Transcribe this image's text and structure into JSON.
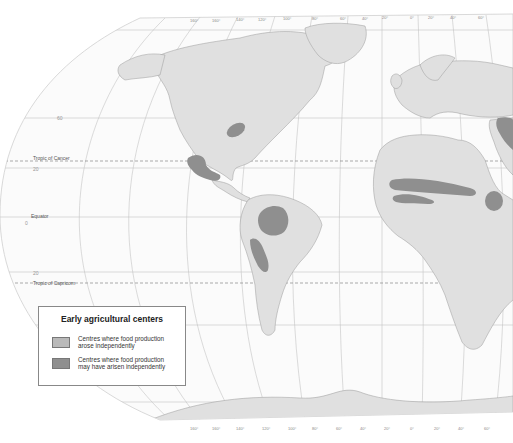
{
  "map": {
    "title": "Early agricultural centers",
    "reference_lines": {
      "tropic_of_cancer": "Tropic of Cancer",
      "equator": "Equator",
      "tropic_of_capricorn": "Tropic of Capricorn"
    },
    "latitude_labels": [
      "60",
      "20",
      "0",
      "20"
    ],
    "longitude_labels_top": [
      "160",
      "160",
      "140",
      "120",
      "100",
      "80",
      "60",
      "40",
      "20",
      "0",
      "20",
      "40",
      "60"
    ],
    "longitude_labels_bottom": [
      "160",
      "160",
      "140",
      "120",
      "100",
      "80",
      "60",
      "40",
      "20",
      "0",
      "20",
      "40",
      "60"
    ],
    "colors": {
      "ocean": "#ffffff",
      "land": "#e0e0e0",
      "coast": "#9a9a9a",
      "grid": "#b8b8b8",
      "centre_independent": "#b9b9b9",
      "centre_possible": "#8f8f8f"
    },
    "regions": [
      {
        "name": "Eastern North America",
        "type": "possible"
      },
      {
        "name": "Mesoamerica",
        "type": "possible"
      },
      {
        "name": "Amazonia",
        "type": "possible"
      },
      {
        "name": "Andes",
        "type": "possible"
      },
      {
        "name": "Sahel",
        "type": "possible"
      },
      {
        "name": "West Africa",
        "type": "possible"
      },
      {
        "name": "Ethiopia",
        "type": "possible"
      },
      {
        "name": "Fertile Crescent",
        "type": "possible"
      }
    ]
  },
  "legend": {
    "title": "Early agricultural centers",
    "items": [
      {
        "label": "Centres where food production arose independently",
        "color": "#b9b9b9"
      },
      {
        "label": "Centres where food production may have arisen independently",
        "color": "#8f8f8f"
      }
    ]
  }
}
